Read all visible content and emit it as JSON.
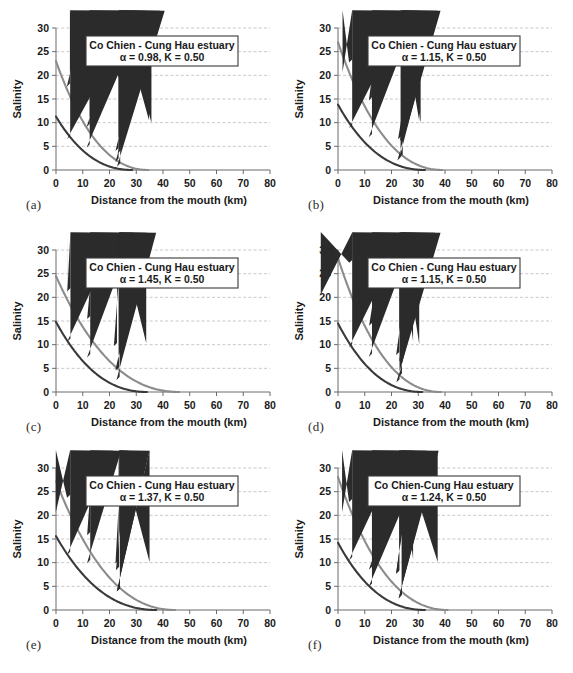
{
  "figure": {
    "axis_titles": {
      "x": "Distance from the mouth (km)",
      "y": "Salinity"
    },
    "colors": {
      "upper_curve": "#8c8c8c",
      "lower_curve": "#3a3a3a",
      "gridline": "#b9b9c4",
      "axis": "#6b6b6b",
      "text": "#1a1a1a",
      "box_border": "#3a3a3a",
      "background": "#ffffff"
    },
    "x_ticks": [
      "0",
      "10",
      "20",
      "30",
      "40",
      "50",
      "60",
      "70",
      "80"
    ],
    "y_ticks": [
      "0",
      "5",
      "10",
      "15",
      "20",
      "25",
      "30"
    ]
  },
  "chart_data": [
    {
      "panel": "(a)",
      "type": "scatter",
      "title": "Co Chien - Cung Hau estuary",
      "params": "α = 0.98, K = 0.50",
      "alpha": 0.98,
      "K": 0.5,
      "xlabel": "Distance from the mouth (km)",
      "ylabel": "Salinity",
      "xlim": [
        0,
        80
      ],
      "ylim": [
        0,
        30
      ],
      "grid": true,
      "legend": "none",
      "series": [
        {
          "name": "high-water salinity (diamonds)",
          "marker": "diamond",
          "color": "#2b2b2b",
          "points": [
            {
              "x": 5.2,
              "y": 17.6
            },
            {
              "x": 12.6,
              "y": 9.1
            },
            {
              "x": 23.4,
              "y": 4.0
            },
            {
              "x": 24.2,
              "y": 3.5
            }
          ],
          "fit_curve": {
            "color": "#8c8c8c",
            "y0": 23.0,
            "x_end": 34.5
          }
        },
        {
          "name": "low-water salinity (triangles)",
          "marker": "triangle",
          "color": "#2b2b2b",
          "points": [
            {
              "x": 5.3,
              "y": 6.5
            },
            {
              "x": 12.6,
              "y": 4.7
            },
            {
              "x": 23.4,
              "y": 1.7
            },
            {
              "x": 24.0,
              "y": 0.7
            }
          ],
          "fit_curve": {
            "color": "#3a3a3a",
            "y0": 11.3,
            "x_end": 28.5
          }
        }
      ]
    },
    {
      "panel": "(b)",
      "type": "scatter",
      "title": "Co Chien - Cung Hau estuary",
      "params": "α = 1.15, K = 0.50",
      "alpha": 1.15,
      "K": 0.5,
      "xlabel": "Distance from the mouth (km)",
      "ylabel": "Salinity",
      "xlim": [
        0,
        80
      ],
      "ylim": [
        0,
        30
      ],
      "grid": true,
      "legend": "none",
      "series": [
        {
          "name": "high-water salinity (diamonds)",
          "marker": "diamond",
          "color": "#2b2b2b",
          "points": [
            {
              "x": 5.3,
              "y": 22.7
            },
            {
              "x": 12.7,
              "y": 14.7
            },
            {
              "x": 23.6,
              "y": 6.5
            },
            {
              "x": 24.3,
              "y": 6.2
            }
          ],
          "fit_curve": {
            "color": "#8c8c8c",
            "y0": 27.0,
            "x_end": 39.0
          }
        },
        {
          "name": "low-water salinity (triangles)",
          "marker": "triangle",
          "color": "#2b2b2b",
          "points": [
            {
              "x": 5.3,
              "y": 8.8
            },
            {
              "x": 12.7,
              "y": 6.9
            },
            {
              "x": 23.4,
              "y": 2.0
            },
            {
              "x": 24.2,
              "y": 2.6
            }
          ],
          "fit_curve": {
            "color": "#3a3a3a",
            "y0": 13.8,
            "x_end": 32.5
          }
        }
      ]
    },
    {
      "panel": "(c)",
      "type": "scatter",
      "title": "Co Chien - Cung Hau estuary",
      "params": "α = 1.45, K = 0.50",
      "alpha": 1.45,
      "K": 0.5,
      "xlabel": "Distance from the mouth (km)",
      "ylabel": "Salinity",
      "xlim": [
        0,
        80
      ],
      "ylim": [
        0,
        30
      ],
      "grid": true,
      "legend": "none",
      "series": [
        {
          "name": "high-water salinity (diamonds)",
          "marker": "diamond",
          "color": "#2b2b2b",
          "points": [
            {
              "x": 5.4,
              "y": 21.3
            },
            {
              "x": 12.8,
              "y": 15.4
            },
            {
              "x": 22.8,
              "y": 9.7
            },
            {
              "x": 23.6,
              "y": 4.6
            }
          ],
          "fit_curve": {
            "color": "#8c8c8c",
            "y0": 24.5,
            "x_end": 46.0
          }
        },
        {
          "name": "low-water salinity (triangles)",
          "marker": "triangle",
          "color": "#2b2b2b",
          "points": [
            {
              "x": 5.4,
              "y": 10.6
            },
            {
              "x": 12.8,
              "y": 7.3
            },
            {
              "x": 23.4,
              "y": 4.6
            },
            {
              "x": 23.8,
              "y": 2.5
            }
          ],
          "fit_curve": {
            "color": "#3a3a3a",
            "y0": 14.8,
            "x_end": 34.0
          }
        }
      ]
    },
    {
      "panel": "(d)",
      "type": "scatter",
      "title": "Co Chien - Cung Hau estuary",
      "params": "α = 1.15, K = 0.50",
      "alpha": 1.15,
      "K": 0.5,
      "xlabel": "Distance from the mouth (km)",
      "ylabel": "Salinity",
      "xlim": [
        0,
        80
      ],
      "ylim": [
        0,
        30
      ],
      "grid": true,
      "legend": "none",
      "series": [
        {
          "name": "high-water salinity (diamonds)",
          "marker": "diamond",
          "color": "#2b2b2b",
          "points": [
            {
              "x": 5.4,
              "y": 27.3
            },
            {
              "x": 12.8,
              "y": 14.0
            },
            {
              "x": 22.9,
              "y": 7.8
            },
            {
              "x": 24.0,
              "y": 6.5
            }
          ],
          "fit_curve": {
            "color": "#8c8c8c",
            "y0": 28.3,
            "x_end": 38.5
          }
        },
        {
          "name": "low-water salinity (triangles)",
          "marker": "triangle",
          "color": "#2b2b2b",
          "points": [
            {
              "x": 5.3,
              "y": 9.4
            },
            {
              "x": 12.7,
              "y": 7.4
            },
            {
              "x": 23.0,
              "y": 2.0
            },
            {
              "x": 23.9,
              "y": 3.2
            }
          ],
          "fit_curve": {
            "color": "#3a3a3a",
            "y0": 14.5,
            "x_end": 31.5
          }
        }
      ]
    },
    {
      "panel": "(e)",
      "type": "scatter",
      "title": "Co Chien - Cung Hau estuary",
      "params": "α = 1.37, K = 0.50",
      "alpha": 1.37,
      "K": 0.5,
      "xlabel": "Distance from the mouth (km)",
      "ylabel": "Salinity",
      "xlim": [
        0,
        80
      ],
      "ylim": [
        0,
        30
      ],
      "grid": true,
      "legend": "none",
      "series": [
        {
          "name": "high-water salinity (diamonds)",
          "marker": "diamond",
          "color": "#2b2b2b",
          "points": [
            {
              "x": 5.3,
              "y": 23.7
            },
            {
              "x": 12.8,
              "y": 15.8
            },
            {
              "x": 23.4,
              "y": 9.8
            },
            {
              "x": 23.9,
              "y": 3.9
            }
          ],
          "fit_curve": {
            "color": "#8c8c8c",
            "y0": 27.2,
            "x_end": 44.5
          }
        },
        {
          "name": "low-water salinity (triangles)",
          "marker": "triangle",
          "color": "#2b2b2b",
          "points": [
            {
              "x": 5.3,
              "y": 11.6
            },
            {
              "x": 12.8,
              "y": 9.9
            },
            {
              "x": 23.6,
              "y": 8.4
            },
            {
              "x": 23.9,
              "y": 3.9
            }
          ],
          "fit_curve": {
            "color": "#3a3a3a",
            "y0": 15.6,
            "x_end": 37.5
          }
        }
      ]
    },
    {
      "panel": "(f)",
      "type": "scatter",
      "title": "Co Chien-Cung Hau estuary",
      "params": "α = 1.24, K = 0.50",
      "alpha": 1.24,
      "K": 0.5,
      "xlabel": "Distance from the mouth (km)",
      "ylabel": "Salinity",
      "xlim": [
        0,
        80
      ],
      "ylim": [
        0,
        30
      ],
      "grid": true,
      "legend": "none",
      "series": [
        {
          "name": "high-water salinity (diamonds)",
          "marker": "diamond",
          "color": "#2b2b2b",
          "points": [
            {
              "x": 5.3,
              "y": 22.8
            },
            {
              "x": 12.7,
              "y": 8.5
            },
            {
              "x": 22.9,
              "y": 7.8
            },
            {
              "x": 23.9,
              "y": 2.6
            }
          ],
          "fit_curve": {
            "color": "#8c8c8c",
            "y0": 28.1,
            "x_end": 41.0
          }
        },
        {
          "name": "low-water salinity (triangles)",
          "marker": "triangle",
          "color": "#2b2b2b",
          "points": [
            {
              "x": 5.3,
              "y": 10.5
            },
            {
              "x": 12.7,
              "y": 4.9
            },
            {
              "x": 22.9,
              "y": 7.6
            },
            {
              "x": 23.8,
              "y": 2.4
            }
          ],
          "fit_curve": {
            "color": "#3a3a3a",
            "y0": 14.2,
            "x_end": 32.5
          }
        }
      ]
    }
  ]
}
